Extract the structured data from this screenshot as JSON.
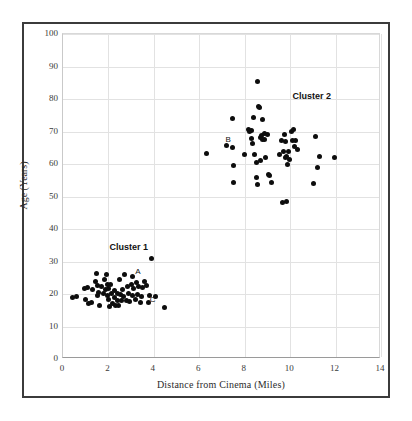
{
  "chart_data": {
    "type": "scatter",
    "title": "",
    "xlabel": "Distance from Cinema (Miles)",
    "ylabel": "Age (Years)",
    "xlim": [
      0,
      14
    ],
    "ylim": [
      0,
      100
    ],
    "xticks": [
      0,
      2,
      4,
      6,
      8,
      10,
      12,
      14
    ],
    "yticks": [
      0,
      10,
      20,
      30,
      40,
      50,
      60,
      70,
      80,
      90,
      100
    ],
    "grid": true,
    "legend": "none",
    "marker": {
      "shape": "circle",
      "color": "#0d0d0d",
      "size": 5
    },
    "annotations": [
      {
        "text": "Cluster 1",
        "x": 2.05,
        "y": 34.5,
        "bold": true
      },
      {
        "text": "Cluster 2",
        "x": 10.1,
        "y": 81.0,
        "bold": true
      },
      {
        "text": "A",
        "x": 3.18,
        "y": 26.8,
        "bold": false
      },
      {
        "text": "B",
        "x": 7.15,
        "y": 67.3,
        "bold": false
      },
      {
        "text": "C",
        "x": 3.82,
        "y": 18.2,
        "bold": false
      }
    ],
    "series": [
      {
        "name": "Cluster 1",
        "points": [
          [
            0.42,
            19.0
          ],
          [
            0.6,
            19.3
          ],
          [
            0.95,
            21.6
          ],
          [
            1.0,
            18.2
          ],
          [
            1.1,
            22.0
          ],
          [
            1.12,
            17.2
          ],
          [
            1.25,
            17.4
          ],
          [
            1.3,
            21.4
          ],
          [
            1.42,
            23.8
          ],
          [
            1.48,
            26.4
          ],
          [
            1.5,
            22.5
          ],
          [
            1.52,
            19.5
          ],
          [
            1.55,
            20.6
          ],
          [
            1.6,
            16.4
          ],
          [
            1.7,
            22.2
          ],
          [
            1.78,
            20.3
          ],
          [
            1.82,
            24.6
          ],
          [
            1.88,
            21.4
          ],
          [
            1.92,
            26.1
          ],
          [
            1.95,
            22.8
          ],
          [
            1.97,
            19.4
          ],
          [
            2.0,
            21.8
          ],
          [
            2.02,
            18.4
          ],
          [
            2.05,
            16.3
          ],
          [
            2.1,
            22.9
          ],
          [
            2.12,
            20.2
          ],
          [
            2.18,
            17.1
          ],
          [
            2.25,
            21.0
          ],
          [
            2.28,
            19.0
          ],
          [
            2.32,
            16.5
          ],
          [
            2.38,
            20.2
          ],
          [
            2.42,
            18.0
          ],
          [
            2.45,
            16.4
          ],
          [
            2.5,
            24.6
          ],
          [
            2.55,
            19.8
          ],
          [
            2.58,
            17.9
          ],
          [
            2.62,
            21.3
          ],
          [
            2.68,
            19.2
          ],
          [
            2.72,
            26.0
          ],
          [
            2.78,
            18.1
          ],
          [
            2.85,
            22.4
          ],
          [
            2.88,
            20.1
          ],
          [
            2.92,
            17.8
          ],
          [
            3.0,
            23.0
          ],
          [
            3.05,
            19.6
          ],
          [
            3.08,
            25.4
          ],
          [
            3.12,
            21.7
          ],
          [
            3.18,
            18.2
          ],
          [
            3.22,
            23.5
          ],
          [
            3.28,
            20.0
          ],
          [
            3.32,
            22.3
          ],
          [
            3.4,
            17.4
          ],
          [
            3.45,
            19.1
          ],
          [
            3.52,
            22.1
          ],
          [
            3.6,
            24.0
          ],
          [
            3.68,
            22.5
          ],
          [
            3.75,
            17.3
          ],
          [
            3.82,
            19.5
          ],
          [
            3.9,
            30.9
          ],
          [
            4.08,
            19.3
          ],
          [
            4.48,
            15.9
          ]
        ]
      },
      {
        "name": "Cluster 2",
        "points": [
          [
            6.3,
            63.1
          ],
          [
            7.22,
            65.8
          ],
          [
            7.45,
            74.1
          ],
          [
            7.48,
            65.0
          ],
          [
            7.5,
            59.6
          ],
          [
            7.52,
            54.3
          ],
          [
            8.0,
            62.9
          ],
          [
            8.18,
            70.6
          ],
          [
            8.22,
            69.9
          ],
          [
            8.28,
            70.3
          ],
          [
            8.3,
            67.8
          ],
          [
            8.35,
            66.2
          ],
          [
            8.4,
            74.4
          ],
          [
            8.45,
            63.0
          ],
          [
            8.5,
            60.4
          ],
          [
            8.52,
            55.8
          ],
          [
            8.55,
            53.8
          ],
          [
            8.58,
            85.5
          ],
          [
            8.62,
            77.7
          ],
          [
            8.65,
            77.4
          ],
          [
            8.68,
            68.2
          ],
          [
            8.7,
            61.0
          ],
          [
            8.72,
            68.9
          ],
          [
            8.78,
            73.7
          ],
          [
            8.8,
            67.5
          ],
          [
            8.85,
            69.3
          ],
          [
            8.88,
            67.6
          ],
          [
            8.92,
            62.0
          ],
          [
            9.0,
            69.2
          ],
          [
            9.05,
            56.9
          ],
          [
            9.1,
            56.4
          ],
          [
            9.2,
            54.4
          ],
          [
            9.55,
            62.8
          ],
          [
            9.6,
            67.2
          ],
          [
            9.65,
            48.3
          ],
          [
            9.7,
            63.8
          ],
          [
            9.75,
            69.2
          ],
          [
            9.78,
            66.8
          ],
          [
            9.8,
            61.9
          ],
          [
            9.82,
            62.4
          ],
          [
            9.85,
            48.4
          ],
          [
            9.88,
            59.9
          ],
          [
            9.92,
            64.0
          ],
          [
            9.95,
            61.4
          ],
          [
            10.05,
            69.9
          ],
          [
            10.1,
            67.3
          ],
          [
            10.15,
            70.5
          ],
          [
            10.2,
            65.5
          ],
          [
            10.25,
            67.2
          ],
          [
            10.32,
            64.6
          ],
          [
            11.05,
            53.9
          ],
          [
            11.1,
            68.6
          ],
          [
            11.2,
            58.9
          ],
          [
            11.3,
            62.3
          ],
          [
            11.95,
            62.1
          ]
        ]
      }
    ]
  }
}
